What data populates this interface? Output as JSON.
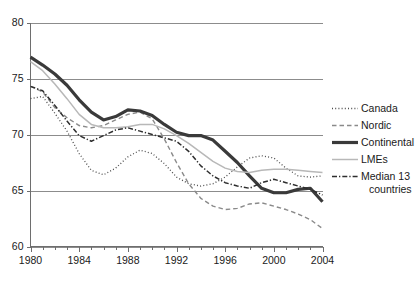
{
  "chart_data": {
    "type": "line",
    "title": "",
    "xlabel": "",
    "ylabel": "",
    "xlim": [
      1980,
      2004
    ],
    "ylim": [
      60,
      80
    ],
    "yticks": [
      60,
      65,
      70,
      75,
      80
    ],
    "ytick_labels": [
      "60",
      "65",
      "70",
      "75",
      "80"
    ],
    "xticks": [
      1980,
      1984,
      1988,
      1992,
      1996,
      2000,
      2004
    ],
    "xtick_labels": [
      "1980",
      "1984",
      "1988",
      "1992",
      "1996",
      "2000",
      "2004"
    ],
    "x_minor_tick_interval": 1,
    "grid": "horizontal",
    "legend_position": "right",
    "x": [
      1980,
      1981,
      1982,
      1983,
      1984,
      1985,
      1986,
      1987,
      1988,
      1989,
      1990,
      1991,
      1992,
      1993,
      1994,
      1995,
      1996,
      1997,
      1998,
      1999,
      2000,
      2001,
      2002,
      2003,
      2004
    ],
    "series": [
      {
        "name": "Canada",
        "style": "dotted",
        "color": "#4d4d4d",
        "width": 1.3,
        "dash": "1,2.2",
        "values": [
          73.2,
          73.4,
          71.9,
          70.3,
          68.3,
          66.8,
          66.4,
          67.0,
          68.0,
          68.6,
          68.3,
          67.4,
          66.2,
          65.6,
          65.4,
          65.6,
          66.2,
          67.1,
          67.9,
          68.1,
          67.9,
          67.0,
          66.3,
          66.2,
          66.3
        ]
      },
      {
        "name": "Nordic",
        "style": "dashed",
        "color": "#8a8a8a",
        "width": 1.4,
        "dash": "4.5,3",
        "values": [
          74.3,
          73.8,
          72.4,
          71.5,
          70.8,
          70.6,
          70.8,
          71.3,
          71.8,
          72.0,
          71.4,
          69.6,
          67.5,
          65.6,
          64.3,
          63.6,
          63.3,
          63.4,
          63.8,
          63.9,
          63.6,
          63.3,
          62.9,
          62.4,
          61.6
        ]
      },
      {
        "name": "Continental",
        "style": "solid-thick",
        "color": "#3a3a3a",
        "width": 3.2,
        "dash": "",
        "values": [
          76.9,
          76.2,
          75.4,
          74.4,
          73.1,
          72.0,
          71.3,
          71.6,
          72.2,
          72.1,
          71.7,
          70.9,
          70.2,
          69.9,
          69.9,
          69.5,
          68.5,
          67.5,
          66.3,
          65.2,
          64.8,
          64.8,
          65.1,
          65.2,
          64.0
        ]
      },
      {
        "name": "LMEs",
        "style": "solid-thin",
        "color": "#b8b8b8",
        "width": 1.5,
        "dash": "",
        "values": [
          76.5,
          75.7,
          74.5,
          73.2,
          71.8,
          70.9,
          70.6,
          70.6,
          70.7,
          70.9,
          70.9,
          70.5,
          69.9,
          69.2,
          68.4,
          67.6,
          67.0,
          66.7,
          66.6,
          66.8,
          66.9,
          66.9,
          66.8,
          66.7,
          66.6
        ]
      },
      {
        "name": "Median 13 countries",
        "style": "dash-dot",
        "color": "#2e2e2e",
        "width": 1.5,
        "dash": "5,2,1.3,2",
        "values": [
          74.3,
          73.9,
          72.6,
          71.2,
          69.9,
          69.4,
          69.9,
          70.4,
          70.6,
          70.3,
          70.0,
          69.7,
          69.4,
          68.5,
          67.2,
          66.3,
          65.7,
          65.4,
          65.2,
          65.7,
          66.0,
          65.7,
          65.4,
          65.1,
          64.6
        ]
      }
    ]
  },
  "legend": {
    "entries": [
      {
        "label": "Canada"
      },
      {
        "label": "Nordic"
      },
      {
        "label": "Continental"
      },
      {
        "label": "LMEs"
      },
      {
        "label": "Median 13"
      },
      {
        "label": "countries"
      }
    ]
  }
}
